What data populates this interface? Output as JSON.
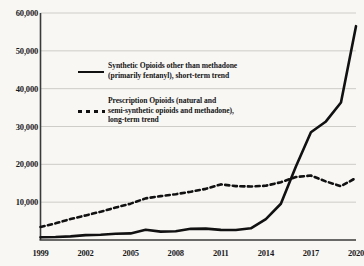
{
  "chart_data": {
    "type": "line",
    "title": "",
    "subtitle": "",
    "xlabel": "",
    "ylabel": "",
    "xlim": [
      1999,
      2020
    ],
    "ylim": [
      0,
      60000
    ],
    "grid": true,
    "grid_axis": "y",
    "legend_position": "inside-upper-left",
    "x": [
      1999,
      2000,
      2001,
      2002,
      2003,
      2004,
      2005,
      2006,
      2007,
      2008,
      2009,
      2010,
      2011,
      2012,
      2013,
      2014,
      2015,
      2016,
      2017,
      2018,
      2019,
      2020
    ],
    "xticks": [
      1999,
      2002,
      2005,
      2008,
      2011,
      2014,
      2017,
      2020
    ],
    "xtick_labels": [
      "1999",
      "2002",
      "2005",
      "2008",
      "2011",
      "2014",
      "2017",
      "2020"
    ],
    "yticks": [
      10000,
      20000,
      30000,
      40000,
      50000,
      60000
    ],
    "ytick_labels": [
      "10,000",
      "20,000",
      "30,000",
      "40,000",
      "50,000",
      "60,000"
    ],
    "series": [
      {
        "name": "Synthetic Opioids other than methadone (primarily fentanyl), short-term trend",
        "style": "solid",
        "color": "#111111",
        "width": 2.6,
        "values": [
          730,
          780,
          960,
          1300,
          1400,
          1660,
          1740,
          2710,
          2210,
          2300,
          2950,
          3010,
          2670,
          2630,
          3100,
          5540,
          9580,
          19410,
          28470,
          31340,
          36360,
          56520
        ]
      },
      {
        "name": "Prescription Opioids (natural and semi-synthetic opioids and methadone), long-term trend",
        "style": "dashed",
        "color": "#111111",
        "width": 2.6,
        "values": [
          3440,
          4400,
          5530,
          6500,
          7460,
          8580,
          9610,
          11000,
          11590,
          12110,
          12760,
          13520,
          14700,
          14250,
          14140,
          14350,
          15280,
          16650,
          17030,
          15470,
          14230,
          16420
        ]
      }
    ]
  },
  "axis": {
    "ytick_labels": [
      "60,000",
      "50,000",
      "40,000",
      "30,000",
      "20,000",
      "10,000"
    ],
    "xtick_labels": [
      "1999",
      "2002",
      "2005",
      "2008",
      "2011",
      "2014",
      "2017",
      "2020"
    ]
  },
  "legend": {
    "entries": [
      {
        "swatch": "solid-line-swatch",
        "line1": "Synthetic Opioids other than methadone",
        "line2": "(primarily fentanyl), short-term trend"
      },
      {
        "swatch": "dashed-line-swatch",
        "line1": "Prescription Opioids (natural and",
        "line2": "semi-synthetic opioids and methadone),",
        "line3": "long-term trend"
      }
    ]
  },
  "colors": {
    "background": "#f8f7f4",
    "line": "#111111",
    "grid": "#c9c7c2",
    "axis": "#3a3a3a",
    "text": "#1a1a1a"
  }
}
